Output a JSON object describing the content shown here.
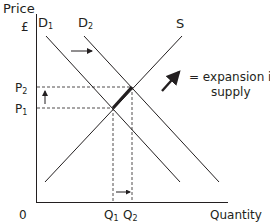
{
  "axes": {
    "y_label": "Price",
    "y_unit": "£",
    "x_label": "Quantity",
    "origin": "0"
  },
  "curves": {
    "d1": "D1",
    "d2": "D2",
    "s": "S"
  },
  "prices": {
    "p1": "P1",
    "p2": "P2"
  },
  "quantities": {
    "q1": "Q1",
    "q2": "Q2"
  },
  "legend": {
    "line1": "= expansion in",
    "line2": "supply"
  },
  "colors": {
    "line": "#231f20",
    "dash": "#231f20"
  }
}
